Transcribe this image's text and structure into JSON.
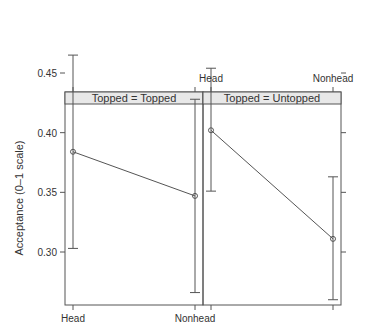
{
  "chart_data": {
    "type": "line",
    "title": "",
    "xlabel": "",
    "ylabel": "Acceptance (0–1 scale)",
    "ylim": [
      0.26,
      0.48
    ],
    "yticks": [
      "0.30",
      "0.35",
      "0.40",
      "0.45"
    ],
    "categories": [
      "Head",
      "Nonhead"
    ],
    "grid": false,
    "legend": "none",
    "panels": [
      {
        "strip": "Topped = Topped",
        "values": [
          0.384,
          0.347
        ],
        "lower": [
          0.303,
          0.266
        ],
        "upper": [
          0.465,
          0.428
        ]
      },
      {
        "strip": "Topped = Untopped",
        "values": [
          0.402,
          0.311
        ],
        "lower": [
          0.351,
          0.26
        ],
        "upper": [
          0.454,
          0.363
        ]
      }
    ]
  }
}
